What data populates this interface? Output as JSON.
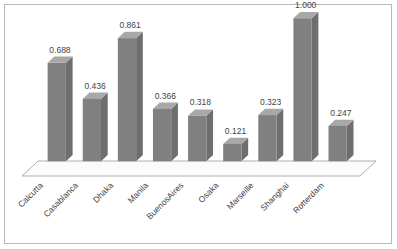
{
  "chart_data": {
    "type": "bar",
    "title": "",
    "subtitle": "",
    "xlabel": "",
    "ylabel": "",
    "categories": [
      "Calcutta",
      "Casablanca",
      "Dhaka",
      "Manila",
      "BuenosAires",
      "Osaka",
      "Marseille",
      "Shanghai",
      "Rotterdam"
    ],
    "values": [
      0.688,
      0.436,
      0.861,
      0.366,
      0.318,
      0.121,
      0.323,
      1.0,
      0.247
    ],
    "data_labels": [
      "0.688",
      "0.436",
      "0.861",
      "0.366",
      "0.318",
      "0.121",
      "0.323",
      "1.000",
      "0.247"
    ],
    "ylim": [
      0,
      1.0
    ],
    "grid": false,
    "legend": false,
    "legend_position": "none",
    "style": "3d-column",
    "axis_tick_labels_rotation_deg": 45,
    "colors": {
      "bar_front": "#808080",
      "bar_top": "#a8a8a8",
      "bar_side": "#6e6e6e",
      "floor_fill": "#fbfbfb",
      "floor_edge": "#a6a6a6",
      "text": "#3f3f3f",
      "frame_border": "#b9b9b9",
      "background": "#ffffff"
    }
  }
}
